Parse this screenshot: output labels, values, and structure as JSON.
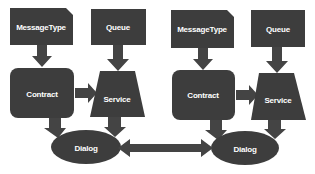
{
  "colors": {
    "shape_fill": "#3d3d3d",
    "arrow_fill": "#444444",
    "text": "#ffffff",
    "background": "#ffffff"
  },
  "left": {
    "message_type": {
      "label": "MessageType"
    },
    "queue": {
      "label": "Queue"
    },
    "contract": {
      "label": "Contract"
    },
    "service": {
      "label": "Service"
    },
    "dialog": {
      "label": "Dialog"
    }
  },
  "right": {
    "message_type": {
      "label": "MessageType"
    },
    "queue": {
      "label": "Queue"
    },
    "contract": {
      "label": "Contract"
    },
    "service": {
      "label": "Service"
    },
    "dialog": {
      "label": "Dialog"
    }
  },
  "connections": [
    {
      "from": "MessageType",
      "to": "Contract",
      "side": "left"
    },
    {
      "from": "Queue",
      "to": "Service",
      "side": "left"
    },
    {
      "from": "Contract",
      "to": "Service",
      "side": "left"
    },
    {
      "from": "Contract",
      "to": "Dialog",
      "side": "left"
    },
    {
      "from": "Service",
      "to": "Dialog",
      "side": "left"
    },
    {
      "from": "MessageType",
      "to": "Contract",
      "side": "right"
    },
    {
      "from": "Queue",
      "to": "Service",
      "side": "right"
    },
    {
      "from": "Contract",
      "to": "Service",
      "side": "right"
    },
    {
      "from": "Contract",
      "to": "Dialog",
      "side": "right"
    },
    {
      "from": "Service",
      "to": "Dialog",
      "side": "right"
    },
    {
      "from": "Dialog",
      "to": "Dialog",
      "side": "between",
      "bidirectional": true
    }
  ]
}
